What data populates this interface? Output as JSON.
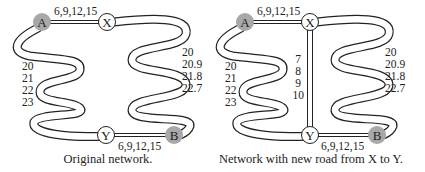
{
  "panels": [
    {
      "caption": "Original network.",
      "nodes": {
        "A": "A",
        "X": "X",
        "Y": "Y",
        "B": "B"
      },
      "edges": {
        "AX": "6,9,12,15",
        "YB": "6,9,12,15",
        "AY": [
          "20",
          "21",
          "22",
          "23"
        ],
        "XB": [
          "20",
          "20.9",
          "21.8",
          "22.7"
        ]
      }
    },
    {
      "caption": "Network with new road from X to Y.",
      "nodes": {
        "A": "A",
        "X": "X",
        "Y": "Y",
        "B": "B"
      },
      "edges": {
        "AX": "6,9,12,15",
        "YB": "6,9,12,15",
        "AY": [
          "20",
          "21",
          "22",
          "23"
        ],
        "XB": [
          "20",
          "20.9",
          "21.8",
          "22.7"
        ],
        "XY": [
          "7",
          "8",
          "9",
          "10"
        ]
      }
    }
  ],
  "colors": {
    "endpoint_fill": "#a8a8a8",
    "intermediate_fill": "#ffffff",
    "stroke": "#222222"
  }
}
